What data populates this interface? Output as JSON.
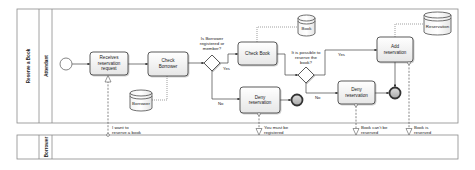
{
  "diagram": {
    "pools": [
      {
        "label": "Reserve a Book",
        "lanes": [
          {
            "label": "Attendant"
          }
        ]
      },
      {
        "label": "",
        "lanes": [
          {
            "label": "Borrower"
          }
        ]
      }
    ],
    "events": {
      "start": "start-event",
      "end_denied": "end-event",
      "end_reserved": "end-event"
    },
    "tasks": {
      "receive_request": [
        "Receives",
        "reservation",
        "request"
      ],
      "check_borrower": [
        "Check",
        "Borrower"
      ],
      "check_book": [
        "Check Book"
      ],
      "deny_not_registered": [
        "Deny",
        "reservation"
      ],
      "deny_not_available": [
        "Deny",
        "reservation"
      ],
      "add_reservation": [
        "Add",
        "reservation"
      ]
    },
    "gateways": {
      "is_registered": {
        "question": [
          "Is Borrower",
          "registered or",
          "member?"
        ],
        "yes": "Yes",
        "no": "No"
      },
      "can_reserve": {
        "question": [
          "It is possible to",
          "reserve the",
          "book?"
        ],
        "yes": "Yes",
        "no": "No"
      }
    },
    "data_stores": {
      "borrower": "Borrower",
      "book": "Book",
      "reservation": "Reservation"
    },
    "messages": [
      {
        "lines": [
          "I want to",
          "reserve a book"
        ]
      },
      {
        "lines": [
          "You must be",
          "registered"
        ]
      },
      {
        "lines": [
          "Book can't be",
          "reserved"
        ]
      },
      {
        "lines": [
          "Book is",
          "reserved"
        ]
      }
    ]
  },
  "colors": {
    "line": "#444444",
    "pool_border": "#8a8a8a",
    "task_fill_top": "#ffffff",
    "task_fill_bottom": "#e6e6e6",
    "end_fill": "#bdbdbd"
  }
}
